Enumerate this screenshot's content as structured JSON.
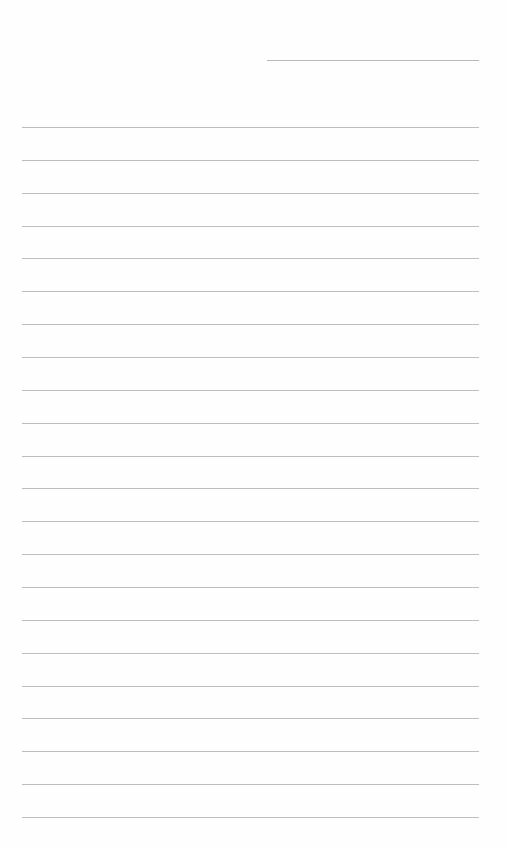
{
  "page": {
    "type": "lined-paper",
    "background_color": "#ffffff",
    "line_color": "#bdbdbd",
    "header_line": {
      "x": 267,
      "y": 60,
      "width": 212
    },
    "ruled_lines": {
      "count": 22,
      "left": 22,
      "width": 457,
      "first_y": 127,
      "spacing": 32.86
    }
  }
}
